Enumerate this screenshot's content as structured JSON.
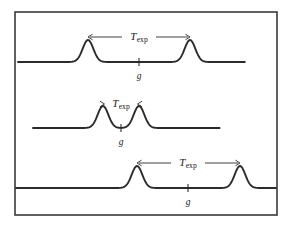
{
  "figure": {
    "type": "scientific-diagram",
    "background_color": "#ffffff",
    "line_color": "#2b2b2b",
    "frame_color": "#3a3a3a",
    "frame": {
      "x": 15,
      "y": 12,
      "width": 262,
      "height": 203
    },
    "labels": {
      "interval_symbol": "T",
      "interval_subscript": "exp",
      "midpoint_symbol": "g"
    },
    "traces": [
      {
        "id": "trace-top",
        "baseline_y": 62,
        "line_start_x": 18,
        "line_end_x": 245,
        "peaks": [
          {
            "center_x": 88,
            "height": 22,
            "width": 7.5
          },
          {
            "center_x": 190,
            "height": 22,
            "width": 7.5
          }
        ],
        "tick_x": 139,
        "tick_height": 8,
        "g_label_x": 139,
        "g_label_y": 79,
        "arrow": {
          "y": 37,
          "x_start": 88,
          "x_end": 190,
          "heads": "outward",
          "label_x": 139,
          "label_y": 40
        }
      },
      {
        "id": "trace-middle",
        "baseline_y": 128,
        "line_start_x": 33,
        "line_end_x": 220,
        "peaks": [
          {
            "center_x": 103,
            "height": 22,
            "width": 7.5
          },
          {
            "center_x": 139,
            "height": 22,
            "width": 7.5
          }
        ],
        "tick_x": 121,
        "tick_height": 8,
        "g_label_x": 121,
        "g_label_y": 145,
        "arrow": {
          "y": 104,
          "x_start": 103,
          "x_end": 139,
          "heads": "inward",
          "label_x": 121,
          "label_y": 107
        }
      },
      {
        "id": "trace-bottom",
        "baseline_y": 188,
        "line_start_x": 16,
        "line_end_x": 276,
        "peaks": [
          {
            "center_x": 137,
            "height": 22,
            "width": 7.5
          },
          {
            "center_x": 240,
            "height": 22,
            "width": 7.5
          }
        ],
        "tick_x": 188,
        "tick_height": 8,
        "g_label_x": 188,
        "g_label_y": 205,
        "arrow": {
          "y": 163,
          "x_start": 137,
          "x_end": 240,
          "heads": "outward",
          "label_x": 188,
          "label_y": 166
        }
      }
    ]
  }
}
